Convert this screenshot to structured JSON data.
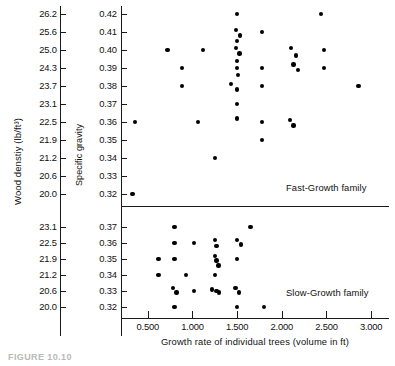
{
  "chart_data": {
    "type": "scatter",
    "title": "",
    "xlabel": "Growth rate of individual trees (volume in ft)",
    "xticks": [
      "0.500",
      "1.000",
      "1.500",
      "2.000",
      "2.500",
      "3.000"
    ],
    "xtick_values": [
      0.5,
      1.0,
      1.5,
      2.0,
      2.5,
      3.0
    ],
    "xlim": [
      0.2,
      3.2
    ],
    "grid": false,
    "legend_position": "in-panel",
    "panels": [
      {
        "name": "Fast-Growth family",
        "label": "Fast-Growth family",
        "y_left_label": "Wood denstiy (lb/ft³)",
        "y_right_label": "Specific gravity",
        "y_left_ticks": [
          "26.2",
          "25.6",
          "25.0",
          "24.3",
          "23.7",
          "23.1",
          "22.5",
          "21.9",
          "21.2",
          "20.6",
          "20.0"
        ],
        "y_left_values": [
          26.2,
          25.6,
          25.0,
          24.3,
          23.7,
          23.1,
          22.5,
          21.9,
          21.2,
          20.6,
          20.0
        ],
        "y_right_ticks": [
          "0.42",
          "0.41",
          "0.40",
          "0.39",
          "0.38",
          "0.37",
          "0.36",
          "0.35",
          "0.34",
          "0.33",
          "0.32"
        ],
        "y_right_values": [
          0.42,
          0.41,
          0.4,
          0.39,
          0.38,
          0.37,
          0.36,
          0.35,
          0.34,
          0.33,
          0.32
        ],
        "points": [
          [
            1.5,
            0.42
          ],
          [
            2.44,
            0.42
          ],
          [
            1.49,
            0.411
          ],
          [
            1.53,
            0.408
          ],
          [
            1.5,
            0.405
          ],
          [
            1.78,
            0.41
          ],
          [
            0.72,
            0.4
          ],
          [
            1.12,
            0.4
          ],
          [
            1.485,
            0.401
          ],
          [
            1.525,
            0.398
          ],
          [
            1.5,
            0.394
          ],
          [
            2.1,
            0.401
          ],
          [
            2.16,
            0.397
          ],
          [
            2.47,
            0.4
          ],
          [
            0.88,
            0.39
          ],
          [
            1.5,
            0.39
          ],
          [
            1.51,
            0.386
          ],
          [
            1.78,
            0.39
          ],
          [
            2.13,
            0.392
          ],
          [
            2.18,
            0.389
          ],
          [
            2.47,
            0.39
          ],
          [
            0.88,
            0.38
          ],
          [
            1.43,
            0.381
          ],
          [
            1.5,
            0.378
          ],
          [
            1.78,
            0.38
          ],
          [
            2.86,
            0.38
          ],
          [
            1.5,
            0.37
          ],
          [
            1.06,
            0.36
          ],
          [
            0.36,
            0.36
          ],
          [
            1.5,
            0.362
          ],
          [
            1.78,
            0.36
          ],
          [
            2.09,
            0.361
          ],
          [
            2.13,
            0.358
          ],
          [
            1.78,
            0.35
          ],
          [
            1.25,
            0.34
          ],
          [
            0.33,
            0.32
          ]
        ]
      },
      {
        "name": "Slow-Growth family",
        "label": "Slow-Growth family",
        "y_left_label": "Wood denstiy (lb/ft³)",
        "y_right_label": "Specific gravity",
        "y_left_ticks": [
          "23.1",
          "22.5",
          "21.9",
          "21.2",
          "20.6",
          "20.0"
        ],
        "y_left_values": [
          23.1,
          22.5,
          21.9,
          21.2,
          20.6,
          20.0
        ],
        "y_right_ticks": [
          "0.37",
          "0.36",
          "0.35",
          "0.34",
          "0.33",
          "0.32"
        ],
        "y_right_values": [
          0.37,
          0.36,
          0.35,
          0.34,
          0.33,
          0.32
        ],
        "points": [
          [
            0.8,
            0.37
          ],
          [
            1.65,
            0.37
          ],
          [
            0.8,
            0.36
          ],
          [
            1.02,
            0.36
          ],
          [
            1.25,
            0.362
          ],
          [
            1.27,
            0.358
          ],
          [
            1.5,
            0.362
          ],
          [
            1.54,
            0.359
          ],
          [
            0.62,
            0.35
          ],
          [
            0.8,
            0.35
          ],
          [
            1.25,
            0.352
          ],
          [
            1.27,
            0.349
          ],
          [
            1.29,
            0.346
          ],
          [
            1.5,
            0.35
          ],
          [
            0.62,
            0.34
          ],
          [
            0.93,
            0.34
          ],
          [
            1.25,
            0.34
          ],
          [
            0.78,
            0.332
          ],
          [
            0.82,
            0.329
          ],
          [
            1.02,
            0.33
          ],
          [
            1.22,
            0.331
          ],
          [
            1.27,
            0.33
          ],
          [
            1.3,
            0.329
          ],
          [
            1.48,
            0.332
          ],
          [
            1.52,
            0.329
          ],
          [
            0.8,
            0.32
          ],
          [
            1.5,
            0.32
          ],
          [
            1.8,
            0.32
          ]
        ]
      }
    ]
  },
  "caption": {
    "text": "FIGURE 10.10"
  }
}
